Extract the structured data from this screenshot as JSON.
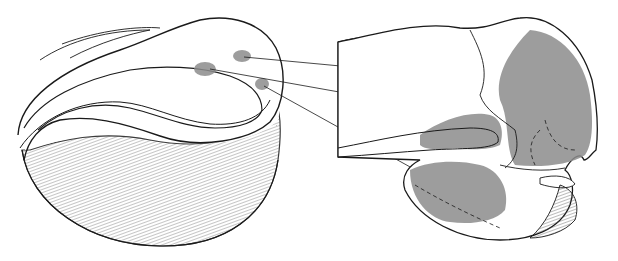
{
  "figure": {
    "colors": {
      "background": "#ffffff",
      "line": "#1a1a1a",
      "shade": "#8c8c8c",
      "stipple": "#555555"
    },
    "left_view": {
      "label": "",
      "spots": [
        {
          "name": "upper-right-spot",
          "cx": 242,
          "cy": 56
        },
        {
          "name": "middle-spot",
          "cx": 205,
          "cy": 69
        },
        {
          "name": "lower-right-spot",
          "cx": 262,
          "cy": 84
        }
      ]
    },
    "right_view": {
      "label": "",
      "regions": [
        "dorsal-region",
        "middle-fold-region",
        "ventral-region"
      ]
    },
    "leader_lines": 3
  }
}
